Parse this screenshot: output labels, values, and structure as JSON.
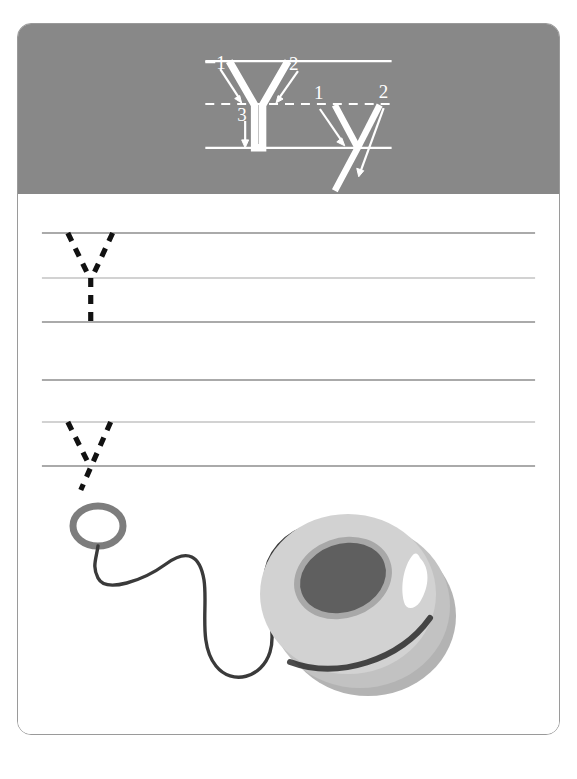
{
  "worksheet": {
    "title": "Letter Y handwriting practice worksheet",
    "letter": "Y",
    "letter_lowercase": "y",
    "border_color": "#9a9a9a",
    "background_color": "#ffffff"
  },
  "header": {
    "band_color": "#888888",
    "guide_color": "#ffffff",
    "stroke_color": "#ffffff",
    "uppercase": {
      "letter": "Y",
      "stroke_count": 3,
      "stroke_labels": [
        "1",
        "2",
        "3"
      ],
      "stroke_order_notes": [
        "1: diagonal down-right from top-left to middle",
        "2: diagonal down-left from top-right to middle",
        "3: straight down from middle to baseline"
      ]
    },
    "lowercase": {
      "letter": "y",
      "stroke_count": 2,
      "stroke_labels": [
        "1",
        "2"
      ],
      "stroke_order_notes": [
        "1: diagonal down-right from midline to baseline",
        "2: diagonal down-left from midline through baseline into descender"
      ]
    },
    "guides": {
      "top_line": "solid",
      "mid_line": "dashed",
      "base_line": "solid"
    }
  },
  "practice": {
    "line_color_solid": "#8e8e8e",
    "line_color_light": "#c3c3c3",
    "trace_color": "#111111",
    "trace_style": "dashed",
    "rows": [
      {
        "row_index": 1,
        "letter": "Y",
        "case": "uppercase",
        "guide_lines": [
          "top",
          "mid",
          "base"
        ],
        "tracing_letters": 1
      },
      {
        "row_index": 2,
        "letter": "y",
        "case": "lowercase",
        "guide_lines": [
          "top",
          "mid",
          "base"
        ],
        "tracing_letters": 1,
        "has_descender": true
      }
    ]
  },
  "illustration": {
    "object": "yo-yo",
    "alt_text": "A gray yo-yo with a string and finger loop",
    "colors": {
      "body_light": "#d2d2d2",
      "body_mid": "#c2c2c2",
      "body_shadow": "#b3b3b3",
      "hub_dark": "#5f5f5f",
      "hub_rim": "#a8a8a8",
      "highlight": "#ffffff",
      "string": "#3a3a3a",
      "ring": "#7d7d7d"
    }
  }
}
